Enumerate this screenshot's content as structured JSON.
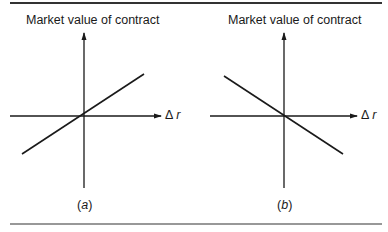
{
  "panels": [
    {
      "id": "a",
      "y_axis_label": "Market value of contract",
      "x_axis_label_symbol": "Δ",
      "x_axis_label_var": "r",
      "caption_open": "(",
      "caption_letter": "a",
      "caption_close": ")",
      "slope": "positive"
    },
    {
      "id": "b",
      "y_axis_label": "Market value of contract",
      "x_axis_label_symbol": "Δ",
      "x_axis_label_var": "r",
      "caption_open": "(",
      "caption_letter": "b",
      "caption_close": ")",
      "slope": "negative"
    }
  ],
  "colors": {
    "ink": "#1a1a1a",
    "rule": "#333333",
    "background": "#ffffff"
  }
}
